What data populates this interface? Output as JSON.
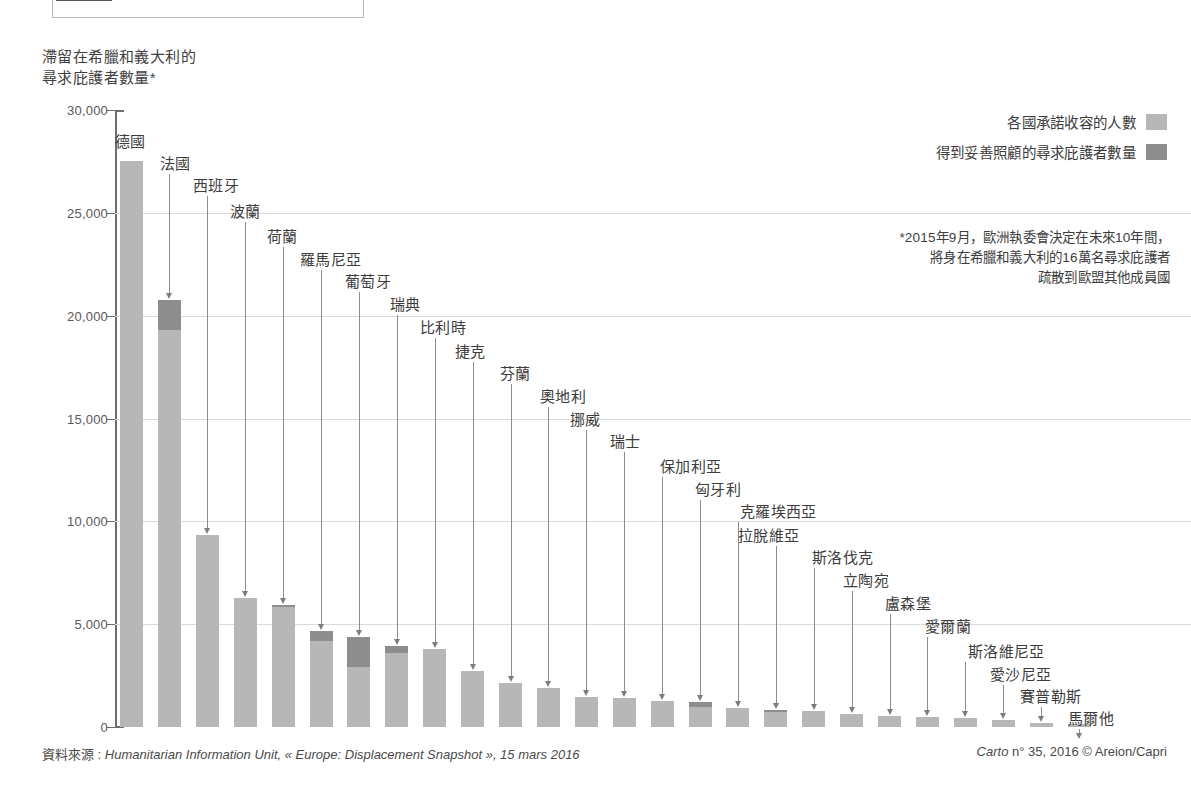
{
  "title_lines": [
    "滯留在希臘和義大利的",
    "尋求庇護者數量*"
  ],
  "legend": {
    "items": [
      {
        "label": "各國承諾收容的人數",
        "color": "#b7b7b7"
      },
      {
        "label": "得到妥善照顧的尋求庇護者數量",
        "color": "#8d8d8d"
      }
    ]
  },
  "footnote_lines": [
    "*2015年9月，歐洲執委會決定在未來10年間，",
    "將身在希臘和義大利的16萬名尋求庇護者",
    "疏散到歐盟其他成員國"
  ],
  "source": {
    "label": "資料來源 : ",
    "italic": "Humanitarian Information Unit, « Europe: Displacement Snapshot », 15 mars 2016"
  },
  "credit": {
    "italic": "Carto",
    "rest": " n° 35, 2016 © Areion/Capri"
  },
  "chart_data": {
    "type": "bar",
    "stacked": true,
    "xlabel": "",
    "ylabel": "",
    "ylim": [
      0,
      30000
    ],
    "yticks": [
      0,
      5000,
      10000,
      15000,
      20000,
      25000,
      30000
    ],
    "ytick_labels": [
      "0",
      "5,000",
      "10,000",
      "15,000",
      "20,000",
      "25,000",
      "30,000"
    ],
    "grid": true,
    "legend_position": "top-right",
    "categories": [
      "德國",
      "法國",
      "西班牙",
      "波蘭",
      "荷蘭",
      "羅馬尼亞",
      "葡萄牙",
      "瑞典",
      "比利時",
      "捷克",
      "芬蘭",
      "奧地利",
      "挪威",
      "瑞士",
      "保加利亞",
      "匈牙利",
      "克羅埃西亞",
      "拉脫維亞",
      "斯洛伐克",
      "立陶宛",
      "盧森堡",
      "愛爾蘭",
      "斯洛維尼亞",
      "愛沙尼亞",
      "賽普勒斯",
      "馬爾他"
    ],
    "series": [
      {
        "name": "各國承諾收容的人數",
        "values": [
          27540,
          20760,
          9350,
          6250,
          5950,
          4650,
          4400,
          3950,
          3800,
          2700,
          2150,
          1900,
          1450,
          1400,
          1250,
          1200,
          900,
          850,
          800,
          650,
          550,
          500,
          450,
          350,
          200,
          130
        ]
      },
      {
        "name": "得到妥善照顧的尋求庇護者數量",
        "values": [
          0,
          1450,
          0,
          0,
          120,
          480,
          1460,
          330,
          0,
          0,
          0,
          0,
          0,
          0,
          0,
          250,
          0,
          120,
          0,
          0,
          0,
          0,
          0,
          0,
          0,
          0
        ]
      }
    ]
  }
}
